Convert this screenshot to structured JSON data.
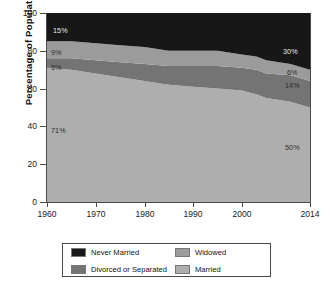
{
  "chart_data": {
    "type": "area",
    "title": "",
    "xlabel": "",
    "ylabel": "Percentage of Population",
    "xlim": [
      1960,
      2014
    ],
    "ylim": [
      0,
      100
    ],
    "grid": false,
    "stacked": true,
    "stack_order": "bottom-to-top: Married, Divorced or Separated, Widowed, Never Married",
    "legend_position": "below-center",
    "x": [
      1960,
      1965,
      1970,
      1975,
      1980,
      1985,
      1990,
      1995,
      2000,
      2003,
      2005,
      2010,
      2014
    ],
    "xticks": [
      1960,
      1970,
      1980,
      1990,
      2000,
      2014
    ],
    "xticklabels": [
      "1960",
      "1970",
      "1980",
      "1990",
      "2000",
      "2014"
    ],
    "yticks": [
      0,
      20,
      40,
      60,
      80,
      100
    ],
    "yticklabels": [
      "0",
      "20",
      "40",
      "60",
      "80",
      "100"
    ],
    "series": [
      {
        "name": "Married",
        "color": "#aeaeae",
        "values": [
          71,
          70,
          68,
          66,
          64,
          62,
          61,
          60,
          59,
          57,
          55,
          53,
          50
        ]
      },
      {
        "name": "Divorced or Separated",
        "color": "#747474",
        "values": [
          5,
          6,
          7,
          8,
          9,
          10,
          11,
          12,
          12,
          13,
          13,
          14,
          14
        ]
      },
      {
        "name": "Widowed",
        "color": "#9b9b9b",
        "values": [
          9,
          9,
          9,
          9,
          9,
          8,
          8,
          8,
          7,
          7,
          7,
          6,
          6
        ]
      },
      {
        "name": "Never Married",
        "color": "#171717",
        "values": [
          15,
          15,
          16,
          17,
          18,
          20,
          20,
          20,
          22,
          23,
          25,
          27,
          30
        ]
      }
    ],
    "annotations": [
      {
        "text": "15%",
        "series": "Never Married",
        "side": "left",
        "value": 15
      },
      {
        "text": "9%",
        "series": "Widowed",
        "side": "left",
        "value": 9
      },
      {
        "text": "5%",
        "series": "Divorced or Separated",
        "side": "left",
        "value": 5
      },
      {
        "text": "71%",
        "series": "Married",
        "side": "left",
        "value": 71
      },
      {
        "text": "30%",
        "series": "Never Married",
        "side": "right",
        "value": 30
      },
      {
        "text": "6%",
        "series": "Widowed",
        "side": "right",
        "value": 6
      },
      {
        "text": "14%",
        "series": "Divorced or Separated",
        "side": "right",
        "value": 14
      },
      {
        "text": "50%",
        "series": "Married",
        "side": "right",
        "value": 50
      }
    ]
  },
  "axis": {
    "y_title": "Percentage of Population",
    "y_ticks": [
      "100",
      "80",
      "60",
      "40",
      "20",
      "0"
    ],
    "x_ticks": [
      "1960",
      "1970",
      "1980",
      "1990",
      "2000",
      "2014"
    ]
  },
  "labels": {
    "left": {
      "never_married": "15%",
      "widowed": "9%",
      "divorced": "5%",
      "married": "71%"
    },
    "right": {
      "never_married": "30%",
      "widowed": "6%",
      "divorced": "14%",
      "married": "50%"
    }
  },
  "legend": {
    "items": [
      {
        "label": "Never Married",
        "color": "#171717"
      },
      {
        "label": "Widowed",
        "color": "#9b9b9b"
      },
      {
        "label": "Divorced or Separated",
        "color": "#747474"
      },
      {
        "label": "Married",
        "color": "#aeaeae"
      }
    ]
  }
}
